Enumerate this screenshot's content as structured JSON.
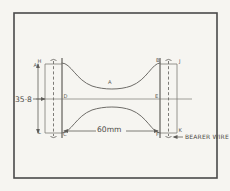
{
  "document": {
    "kind": "hand-drawn engineering sketch",
    "subject": "waisted tensile test specimen with bearer wires"
  },
  "dimensions": {
    "height_label": "35·8",
    "width_label": "60mm"
  },
  "annotations": {
    "bearer_wire_note": "BEARER WIRE"
  },
  "point_labels": {
    "top_left": "H",
    "upper_mid_left": "A",
    "center_left": "D",
    "center_right": "E",
    "top_right": "B",
    "top_far_right": "J",
    "bottom_left": "L",
    "bottom_mid_left": "C",
    "bottom_right": "F",
    "bottom_far_right": "K",
    "curve_center": "A"
  },
  "colors": {
    "paper": "#f6f5f1",
    "frame": "#4a4a4a",
    "ink": "#5f5d59",
    "pencil": "#6e6c68"
  }
}
